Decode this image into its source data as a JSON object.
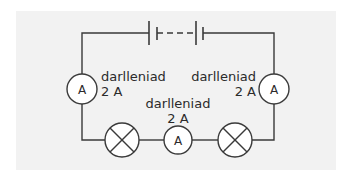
{
  "diagram": {
    "type": "series circuit",
    "colors": {
      "background": "#f2f2f2",
      "wire": "#3a3a3a",
      "component_fill": "#ffffff"
    },
    "battery": {
      "label": "",
      "cells": 2,
      "style": "dashed-link"
    },
    "ammeters": [
      {
        "id": "left",
        "symbol": "A",
        "caption": "darlleniad",
        "value": "2 A"
      },
      {
        "id": "right",
        "symbol": "A",
        "caption": "darlleniad",
        "value": "2 A"
      },
      {
        "id": "middle",
        "symbol": "A",
        "caption": "darlleniad",
        "value": "2 A"
      }
    ],
    "lamps": [
      {
        "id": "lamp-1",
        "symbol": "lamp-cross"
      },
      {
        "id": "lamp-2",
        "symbol": "lamp-cross"
      }
    ]
  }
}
